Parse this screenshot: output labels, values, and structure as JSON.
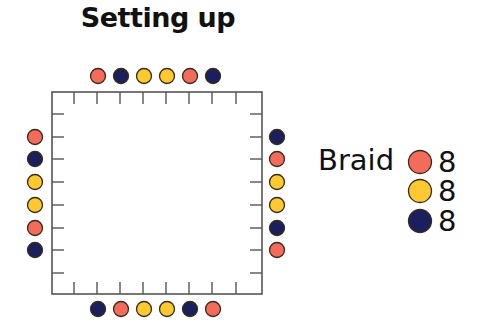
{
  "title": "Setting up",
  "colors": {
    "salmon": "#f26b5b",
    "navy": "#1a1f5e",
    "yellow": "#fcc930",
    "outline": "#3a2a1a",
    "frame": "#555555"
  },
  "board": {
    "shape": "square",
    "ticks_per_side": 8,
    "top_dots": [
      "salmon",
      "navy",
      "yellow",
      "yellow",
      "salmon",
      "navy"
    ],
    "bottom_dots": [
      "navy",
      "salmon",
      "yellow",
      "yellow",
      "navy",
      "salmon"
    ],
    "left_dots": [
      "salmon",
      "navy",
      "yellow",
      "yellow",
      "salmon",
      "navy"
    ],
    "right_dots": [
      "navy",
      "salmon",
      "yellow",
      "yellow",
      "navy",
      "salmon"
    ]
  },
  "legend": {
    "label": "Braid",
    "items": [
      {
        "color": "salmon",
        "count": "8"
      },
      {
        "color": "yellow",
        "count": "8"
      },
      {
        "color": "navy",
        "count": "8"
      }
    ]
  }
}
